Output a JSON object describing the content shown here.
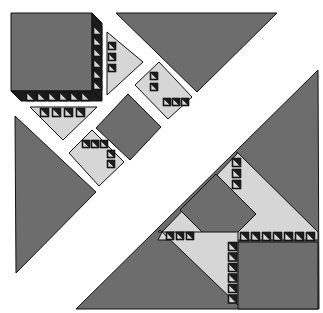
{
  "diagram": {
    "title": "",
    "type": "quilt-block-exploded-assembly",
    "colors": {
      "background": "#ffffff",
      "dark_gray": "#6d6d6d",
      "medium_gray": "#a9a9a9",
      "light_gray": "#d6d6d6",
      "black": "#1c1c1c",
      "outline": "#111111"
    },
    "pieces": [
      {
        "name": "top-left-square-unit",
        "fill": "dark_gray",
        "points": "11,13 92,13 92,91 11,91"
      },
      {
        "name": "top-left-strip-right",
        "fill": "black",
        "points": "92,13 102,23 102,101 92,91"
      },
      {
        "name": "top-left-strip-bottom",
        "fill": "black",
        "points": "11,91 92,91 102,101 21,101"
      },
      {
        "name": "top-setting-triangle",
        "fill": "dark_gray",
        "points": "116,13 277,13 197,92"
      },
      {
        "name": "left-setting-triangle",
        "fill": "dark_gray",
        "points": "15,116 96,192 16,273"
      },
      {
        "name": "top-small-half-square",
        "fill": "light_gray",
        "points": "107,32 143,62 107,95"
      },
      {
        "name": "left-small-half-square",
        "fill": "light_gray",
        "points": "30,107 97,107 63,140"
      },
      {
        "name": "right-small-diamond",
        "fill": "light_gray",
        "points": "135,85 159,62 192,97 168,119"
      },
      {
        "name": "bottom-small-diamond",
        "fill": "light_gray",
        "points": "69,153 92,130 124,162 99,186"
      },
      {
        "name": "center-diamond",
        "fill": "dark_gray",
        "points": "96,128 128,94 161,127 130,160"
      },
      {
        "name": "large-right-triangle",
        "fill": "dark_gray",
        "points": "318,70 319,309 76,309"
      },
      {
        "name": "assembled-light-band-upper",
        "fill": "light_gray",
        "points": "237,152 318,232 318,240 230,240 158,240 162,232 237,154"
      },
      {
        "name": "assembled-center-diamond",
        "fill": "dark_gray",
        "points": "180,210 216,174 256,214 220,250"
      },
      {
        "name": "assembled-light-band-lower",
        "fill": "light_gray",
        "points": "158,232 238,232 238,305 160,230"
      },
      {
        "name": "assembled-right-square",
        "fill": "dark_gray",
        "points": "238,242 318,242 318,309 238,309"
      }
    ],
    "triangle_strips": [
      {
        "name": "top-left-right-edge-teeth",
        "x": 93,
        "y": 26,
        "dir": "v",
        "count": 6,
        "step": 11,
        "size": 9
      },
      {
        "name": "top-left-bottom-edge-teeth",
        "x": 26,
        "y": 92,
        "dir": "h",
        "count": 6,
        "step": 11,
        "size": 9
      },
      {
        "name": "assembled-horizontal-teeth",
        "x": 240,
        "y": 232,
        "dir": "h",
        "count": 7,
        "step": 11,
        "size": 9
      },
      {
        "name": "assembled-vertical-teeth",
        "x": 228,
        "y": 242,
        "dir": "v",
        "count": 6,
        "step": 10.5,
        "size": 9
      },
      {
        "name": "assembled-upper-diag-teeth",
        "x": 232,
        "y": 158,
        "dir": "v",
        "count": 3,
        "step": 11,
        "size": 9
      },
      {
        "name": "assembled-left-horizontal-teeth",
        "x": 166,
        "y": 232,
        "dir": "h",
        "count": 3,
        "step": 10,
        "size": 8
      },
      {
        "name": "right-diamond-teeth",
        "x": 150,
        "y": 72,
        "dir": "v",
        "count": 2,
        "step": 11,
        "size": 8
      },
      {
        "name": "right-diamond-bottom-teeth",
        "x": 163,
        "y": 98,
        "dir": "h",
        "count": 3,
        "step": 9,
        "size": 8
      },
      {
        "name": "bottom-diamond-teeth",
        "x": 82,
        "y": 140,
        "dir": "h",
        "count": 3,
        "step": 9,
        "size": 8
      },
      {
        "name": "bottom-diamond-side-teeth",
        "x": 107,
        "y": 150,
        "dir": "v",
        "count": 2,
        "step": 10,
        "size": 8
      },
      {
        "name": "top-half-square-teeth",
        "x": 108,
        "y": 42,
        "dir": "v",
        "count": 3,
        "step": 11,
        "size": 8
      },
      {
        "name": "left-half-square-teeth",
        "x": 40,
        "y": 108,
        "dir": "h",
        "count": 4,
        "step": 12,
        "size": 9
      }
    ]
  }
}
